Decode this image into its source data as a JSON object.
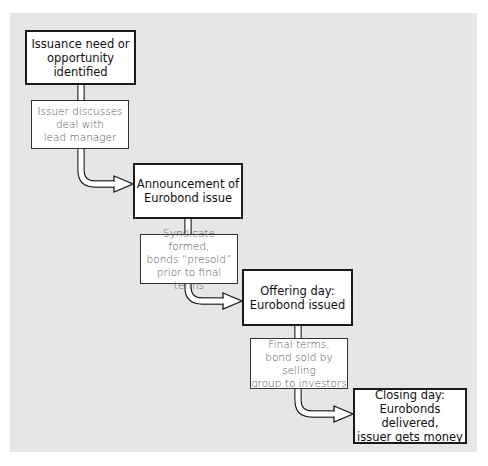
{
  "diagram": {
    "colors": {
      "panel_bg": "#e6e6e6",
      "box_bg": "#ffffff",
      "border": "#1a1a1a",
      "note_text": "#555555"
    },
    "steps": [
      {
        "id": "step-1",
        "type": "stage",
        "text": "Issuance need or\nopportunity identified"
      },
      {
        "id": "note-1",
        "type": "activity",
        "text": "Issuer discusses\ndeal with\nlead manager"
      },
      {
        "id": "step-2",
        "type": "stage",
        "text": "Announcement of\nEurobond issue"
      },
      {
        "id": "note-2",
        "type": "activity",
        "text": "Syndicate formed,\nbonds “presold”\nprior to final terms"
      },
      {
        "id": "step-3",
        "type": "stage",
        "text": "Offering day:\nEurobond issued"
      },
      {
        "id": "note-3",
        "type": "activity",
        "text": "Final terms,\nbond sold by selling\ngroup to investors"
      },
      {
        "id": "step-4",
        "type": "stage",
        "text": "Closing day:\nEurobonds delivered,\nissuer gets money"
      }
    ],
    "edges": [
      {
        "from": "step-1",
        "via": "note-1",
        "to": "step-2",
        "icon": "hollow-arrow-right"
      },
      {
        "from": "step-2",
        "via": "note-2",
        "to": "step-3",
        "icon": "hollow-arrow-right"
      },
      {
        "from": "step-3",
        "via": "note-3",
        "to": "step-4",
        "icon": "hollow-arrow-right"
      }
    ]
  }
}
